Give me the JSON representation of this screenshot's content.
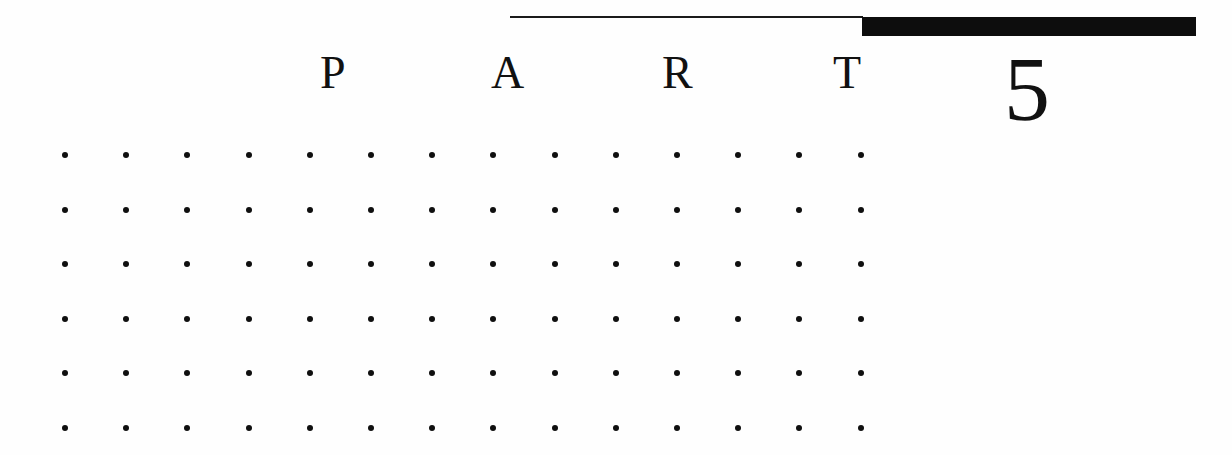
{
  "page": {
    "kind": "book-part-divider",
    "background_color": "#fefefe",
    "ink_color": "#111111",
    "width": 1232,
    "height": 455
  },
  "header": {
    "thin_rule": {
      "name": "thin-rule",
      "color": "#1a1a1a",
      "x": 510,
      "y": 16,
      "width": 353,
      "height": 2
    },
    "thick_bar": {
      "name": "thick-bar",
      "color": "#0d0d0d",
      "x": 862,
      "y": 17,
      "width": 334,
      "height": 19
    }
  },
  "wordmark": {
    "text": "PART",
    "letters": [
      "P",
      "A",
      "R",
      "T"
    ],
    "letter_spacing_px": 171,
    "font_size_px": 46
  },
  "part_number": {
    "value": "5",
    "font_size_px": 92
  },
  "dot_grid": {
    "columns": 14,
    "rows": 6,
    "column_spacing_px": 61.2,
    "row_spacing_px": 54.6,
    "dot_diameter_px": 6,
    "dot_color": "#0f0f0f"
  }
}
